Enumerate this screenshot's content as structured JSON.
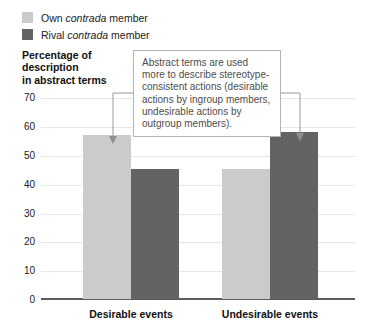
{
  "chart_data": {
    "type": "bar",
    "title": "",
    "xlabel": "",
    "ylabel": "Percentage of description in abstract terms",
    "ylim": [
      0,
      75
    ],
    "yticks": [
      0,
      10,
      20,
      30,
      40,
      50,
      60,
      70
    ],
    "grid": true,
    "legend_position": "top-left",
    "categories": [
      "Desirable events",
      "Undesirable events"
    ],
    "series": [
      {
        "name": "Own contrada member",
        "color": "#cbcbcb",
        "values": [
          57,
          45
        ]
      },
      {
        "name": "Rival contrada member",
        "color": "#636363",
        "values": [
          45,
          58
        ]
      }
    ],
    "annotations": [
      "Abstract terms are used more to describe stereotype-consistent actions (desirable actions by ingroup members, undesirable actions by outgroup members)."
    ]
  },
  "legend": {
    "items": [
      {
        "label_pre": "Own ",
        "label_em": "contrada",
        "label_post": " member",
        "color": "#cbcbcb"
      },
      {
        "label_pre": "Rival ",
        "label_em": "contrada",
        "label_post": " member",
        "color": "#636363"
      }
    ]
  },
  "axis": {
    "y_title_line1": "Percentage of",
    "y_title_line2": "description",
    "y_title_line3": "in abstract terms",
    "y_ticks": [
      "70",
      "60",
      "50",
      "40",
      "30",
      "20",
      "10",
      "0"
    ],
    "x_categories": [
      "Desirable events",
      "Undesirable events"
    ]
  },
  "annotation": {
    "line1": "Abstract terms are used",
    "line2": "more to describe stereotype-",
    "line3": "consistent actions (desirable",
    "line4": "actions by ingroup members,",
    "line5": "undesirable actions by",
    "line6": "outgroup members)."
  },
  "bars": {
    "g1_own": "57",
    "g1_rival": "45",
    "g2_own": "45",
    "g2_rival": "58"
  }
}
